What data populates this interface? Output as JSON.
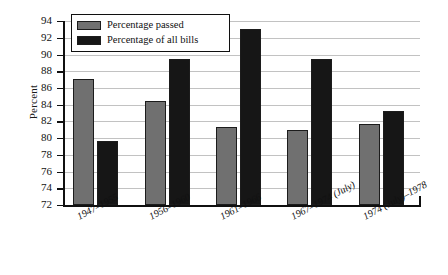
{
  "chart_data": {
    "type": "bar",
    "title": "",
    "xlabel": "",
    "ylabel": "Percent",
    "ylim": [
      72,
      94
    ],
    "ytick_step": 2,
    "yticks": [
      94,
      92,
      90,
      88,
      86,
      84,
      82,
      80,
      78,
      76,
      74,
      72
    ],
    "grid": true,
    "legend_position": "top-left",
    "categories": [
      "1947–1955",
      "1956–1960",
      "1961–1966",
      "1967–1974 (July)",
      "1974 (July)–1978"
    ],
    "series": [
      {
        "name": "Percentage passed",
        "color": "#707070",
        "values": [
          87.1,
          84.5,
          81.3,
          81.0,
          81.7
        ]
      },
      {
        "name": "Percentage of all bills",
        "color": "#161616",
        "values": [
          79.6,
          89.5,
          93.0,
          89.5,
          83.3
        ]
      }
    ]
  },
  "legend": {
    "items": [
      {
        "label": "Percentage passed",
        "swatch": "series-passed"
      },
      {
        "label": "Percentage of all bills",
        "swatch": "series-allbills"
      }
    ]
  },
  "axes": {
    "y_title": "Percent"
  }
}
